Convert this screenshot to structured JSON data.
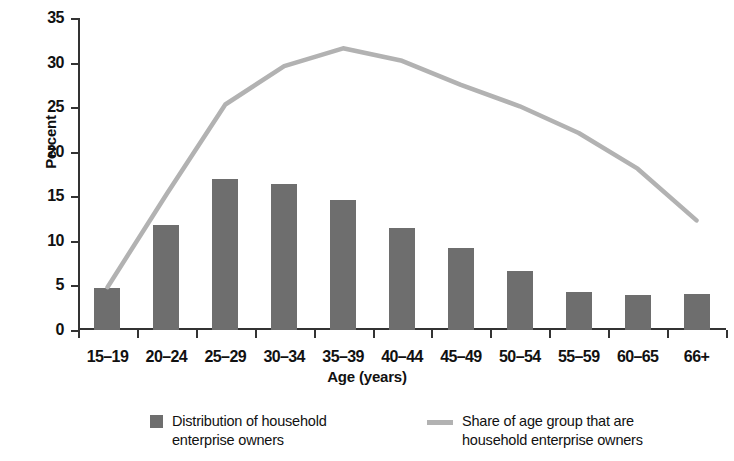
{
  "chart_data": {
    "type": "bar",
    "title": "",
    "xlabel": "Age (years)",
    "ylabel": "Percent",
    "categories": [
      "15–19",
      "20–24",
      "25–29",
      "30–34",
      "35–39",
      "40–44",
      "45–49",
      "50–54",
      "55–59",
      "60–65",
      "66+"
    ],
    "ylim": [
      0,
      35
    ],
    "yticks": [
      0,
      5,
      10,
      15,
      20,
      25,
      30,
      35
    ],
    "ytick_labels": [
      "0",
      "5",
      "10",
      "15",
      "20",
      "25",
      "30",
      "35"
    ],
    "grid": false,
    "legend_position": "bottom",
    "series": [
      {
        "name": "Distribution of household enterprise owners",
        "type": "bar",
        "color": "#6e6e6e",
        "values": [
          4.7,
          11.8,
          16.9,
          16.4,
          14.6,
          11.4,
          9.2,
          6.6,
          4.3,
          3.9,
          4.0
        ]
      },
      {
        "name": "Share of age group that are household enterprise owners",
        "type": "line",
        "color": "#b2b2b2",
        "values": [
          4.8,
          15.2,
          25.3,
          29.6,
          31.6,
          30.2,
          27.5,
          25.1,
          22.1,
          18.1,
          12.3
        ]
      }
    ]
  },
  "legend": {
    "items": [
      {
        "label": "Distribution of household enterprise owners",
        "marker": "square",
        "color": "#6e6e6e"
      },
      {
        "label": "Share of age group that are household enterprise owners",
        "marker": "line",
        "color": "#b2b2b2"
      }
    ]
  }
}
